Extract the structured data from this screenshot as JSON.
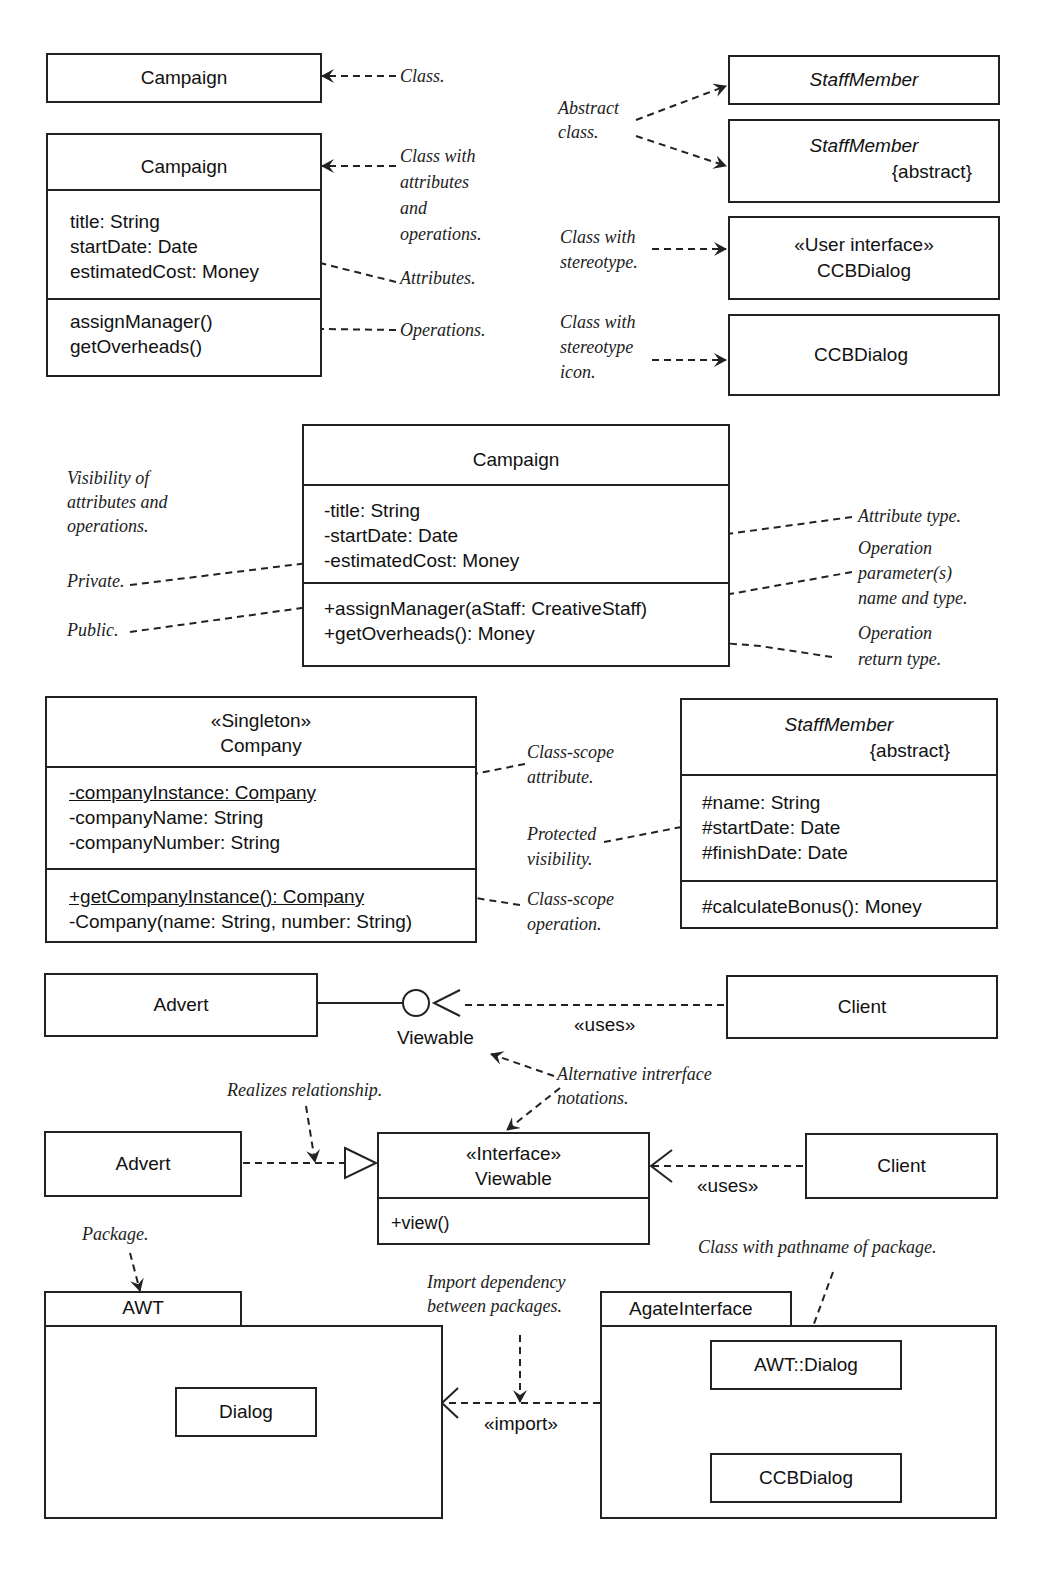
{
  "classes": {
    "simple": {
      "name": "Campaign"
    },
    "full": {
      "name": "Campaign",
      "attributes": [
        "title: String",
        "startDate: Date",
        "estimatedCost: Money"
      ],
      "operations": [
        "assignManager()",
        "getOverheads()"
      ]
    },
    "abstract1": {
      "name": "StaffMember"
    },
    "abstract2": {
      "name": "StaffMember",
      "constraint": "{abstract}"
    },
    "stereo": {
      "stereotype": "«User interface»",
      "name": "CCBDialog"
    },
    "stereo_icon": {
      "name": "CCBDialog"
    },
    "visibility": {
      "name": "Campaign",
      "attributes": [
        "-title: String",
        "-startDate: Date",
        "-estimatedCost: Money"
      ],
      "operations": [
        "+assignManager(aStaff: CreativeStaff)",
        "+getOverheads(): Money"
      ]
    },
    "singleton": {
      "stereotype": "«Singleton»",
      "name": "Company",
      "attributes": [
        "-companyInstance: Company",
        "-companyName: String",
        "-companyNumber: String"
      ],
      "operations": [
        "+getCompanyInstance(): Company",
        "-Company(name: String, number: String)"
      ]
    },
    "staff": {
      "name": "StaffMember",
      "constraint": "{abstract}",
      "attributes": [
        "#name: String",
        "#startDate: Date",
        "#finishDate: Date"
      ],
      "operations": [
        "#calculateBonus(): Money"
      ]
    },
    "advert1": {
      "name": "Advert"
    },
    "client1": {
      "name": "Client"
    },
    "advert2": {
      "name": "Advert"
    },
    "client2": {
      "name": "Client"
    },
    "interface": {
      "stereotype": "«Interface»",
      "name": "Viewable",
      "operations": [
        "+view()"
      ]
    }
  },
  "lollipop_label": "Viewable",
  "uses_label": "«uses»",
  "import_label": "«import»",
  "packages": {
    "awt": {
      "name": "AWT",
      "class": "Dialog"
    },
    "agate": {
      "name": "AgateInterface",
      "classes": [
        "AWT::Dialog",
        "CCBDialog"
      ]
    }
  },
  "notes": {
    "class": "Class.",
    "class_with": [
      "Class with",
      "attributes",
      "and",
      "operations."
    ],
    "attributes": "Attributes.",
    "operations": "Operations.",
    "abstract": [
      "Abstract",
      "class."
    ],
    "stereotype": [
      "Class with",
      "stereotype."
    ],
    "stereotype_icon": [
      "Class with",
      "stereotype",
      "icon."
    ],
    "visibility": [
      "Visibility of",
      "attributes and",
      "operations."
    ],
    "private": "Private.",
    "public": "Public.",
    "attr_type": "Attribute type.",
    "op_param": [
      "Operation",
      "parameter(s)",
      "name and type."
    ],
    "op_return": [
      "Operation",
      "return type."
    ],
    "class_scope_attr": [
      "Class-scope",
      "attribute."
    ],
    "protected": [
      "Protected",
      "visibility."
    ],
    "class_scope_op": [
      "Class-scope",
      "operation."
    ],
    "alt_interface": [
      "Alternative intrerface",
      "notations."
    ],
    "realizes": "Realizes relationship.",
    "package": "Package.",
    "import_dep": [
      "Import dependency",
      "between packages."
    ],
    "pathname": "Class with pathname of package."
  }
}
